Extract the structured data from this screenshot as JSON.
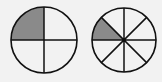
{
  "diagram": {
    "type": "fraction-circles",
    "background": "#f2f2f2",
    "line_color": "#111111",
    "fill_color": "#8a8a8a",
    "circles": [
      {
        "name": "quarters-circle",
        "cx": 44,
        "cy": 40,
        "r": 33,
        "parts": 4,
        "shaded_parts": 1,
        "fraction": "1/4"
      },
      {
        "name": "eighths-circle",
        "cx": 124,
        "cy": 40,
        "r": 32,
        "parts": 8,
        "shaded_parts": 1,
        "fraction": "1/8"
      }
    ]
  }
}
